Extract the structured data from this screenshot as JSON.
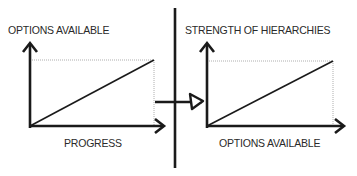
{
  "diagram": {
    "left_chart": {
      "y_label": "OPTIONS AVAILABLE",
      "x_label": "PROGRESS"
    },
    "right_chart": {
      "y_label": "STRENGTH OF HIERARCHIES",
      "x_label": "OPTIONS AVAILABLE"
    },
    "colors": {
      "line": "#1a1a1a",
      "dotted": "#888888",
      "text": "#2a2a2a"
    }
  }
}
